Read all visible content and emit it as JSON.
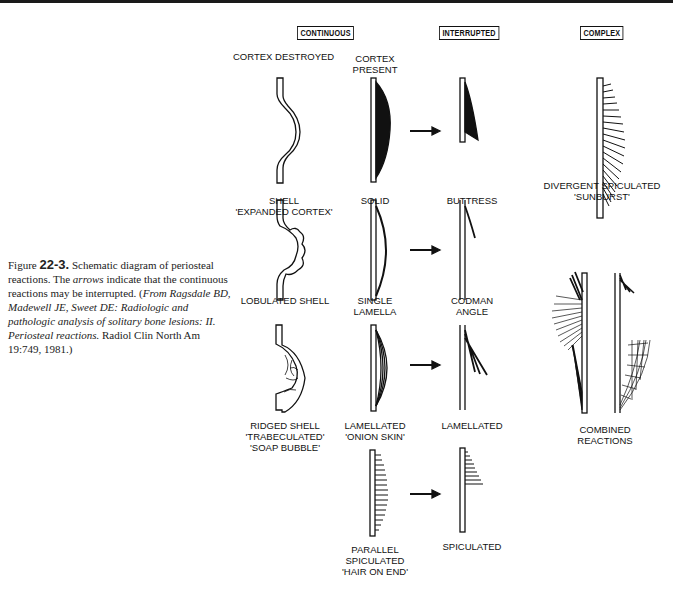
{
  "caption": {
    "figure_word": "Figure",
    "figure_number": "22-3.",
    "text_1": " Schematic diagram of periosteal reactions. The ",
    "arrows_word": "arrows",
    "text_2": " indicate that the continuous reactions may be interrupted. (",
    "source": "From Ragsdale BD, Madewell JE, Sweet DE: Radiologic and pathologic analysis of solitary bone lesions: II. Periosteal reactions.",
    "journal": " Radiol Clin North Am 19:749, 1981.)"
  },
  "headers": {
    "continuous": "CONTINUOUS",
    "interrupted": "INTERRUPTED",
    "complex": "COMPLEX"
  },
  "subheaders": {
    "cortex_destroyed": "CORTEX DESTROYED",
    "cortex_present_1": "CORTEX",
    "cortex_present_2": "PRESENT"
  },
  "labels": {
    "shell_1": "SHELL",
    "shell_2": "'EXPANDED CORTEX'",
    "solid": "SOLID",
    "buttress": "BUTTRESS",
    "divergent_1": "DIVERGENT SPICULATED",
    "divergent_2": "'SUNBURST'",
    "lobulated": "LOBULATED SHELL",
    "single_1": "SINGLE",
    "single_2": "LAMELLA",
    "codman_1": "CODMAN",
    "codman_2": "ANGLE",
    "ridged_1": "RIDGED SHELL",
    "ridged_2": "'TRABECULATED'",
    "ridged_3": "'SOAP BUBBLE'",
    "lamellated_1": "LAMELLATED",
    "lamellated_2": "'ONION SKIN'",
    "lamellated_int": "LAMELLATED",
    "combined_1": "COMBINED",
    "combined_2": "REACTIONS",
    "parallel_1": "PARALLEL",
    "parallel_2": "SPICULATED",
    "parallel_3": "'HAIR ON END'",
    "spiculated": "SPICULATED"
  }
}
